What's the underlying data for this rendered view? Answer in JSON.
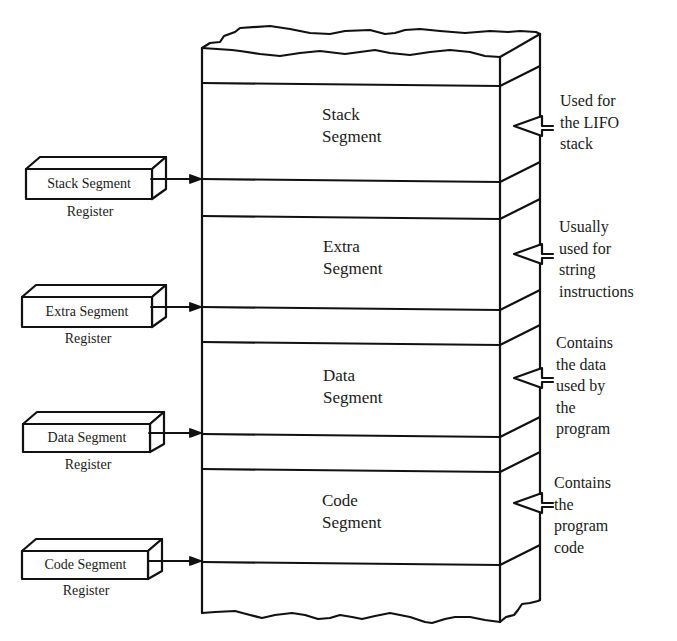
{
  "diagram": {
    "type": "memory-segmentation",
    "segments": [
      {
        "line1": "Stack",
        "line2": "Segment",
        "note": [
          "Used for",
          "the LIFO",
          "stack"
        ]
      },
      {
        "line1": "Extra",
        "line2": "Segment",
        "note": [
          "Usually",
          "used for",
          "string",
          "instructions"
        ]
      },
      {
        "line1": "Data",
        "line2": "Segment",
        "note": [
          "Contains",
          "the data",
          "used by",
          "the",
          "program"
        ]
      },
      {
        "line1": "Code",
        "line2": "Segment",
        "note": [
          "Contains",
          "the",
          "program",
          "code"
        ]
      }
    ],
    "registers": [
      {
        "name": "Stack Segment",
        "sub": "Register"
      },
      {
        "name": "Extra Segment",
        "sub": "Register"
      },
      {
        "name": "Data Segment",
        "sub": "Register"
      },
      {
        "name": "Code Segment",
        "sub": "Register"
      }
    ],
    "colors": {
      "stroke": "#111111",
      "background": "#ffffff"
    }
  }
}
